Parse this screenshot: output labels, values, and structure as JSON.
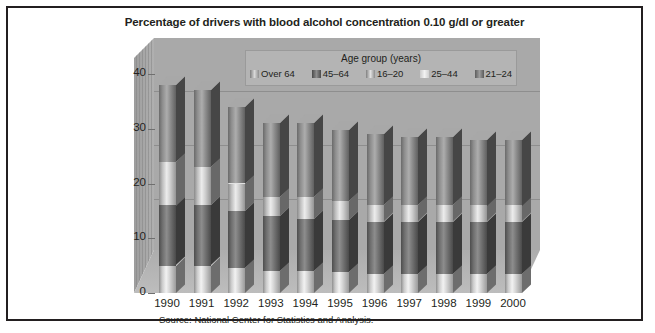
{
  "title": "Percentage of drivers with blood alcohol concentration 0.10 g/dl or greater",
  "source": "Source: National Center for Statistics and Analysis.",
  "legend": {
    "title": "Age group (years)",
    "items": [
      {
        "label": "Over 64",
        "swatch": "legend-swatch-over-64"
      },
      {
        "label": "45–64",
        "swatch": "legend-swatch-45-64"
      },
      {
        "label": "16–20",
        "swatch": "legend-swatch-16-20"
      },
      {
        "label": "25–44",
        "swatch": "legend-swatch-25-44"
      },
      {
        "label": "21–24",
        "swatch": "legend-swatch-21-24"
      }
    ]
  },
  "axes": {
    "y_ticks": [
      "0",
      "10",
      "20",
      "30",
      "40"
    ],
    "x_ticks": [
      "1990",
      "1991",
      "1992",
      "1993",
      "1994",
      "1995",
      "1996",
      "1997",
      "1998",
      "1999",
      "2000"
    ]
  },
  "colors": {
    "frame_border": "#231f20",
    "back_wall": "#a9a9a9",
    "floor": "#b5b5b5",
    "legend_bg": "#b4b4b4",
    "text": "#231f20"
  },
  "chart_data": {
    "type": "bar",
    "subtype": "3d-stacked-column",
    "title": "Percentage of drivers with blood alcohol concentration 0.10 g/dl or greater",
    "xlabel": "",
    "ylabel": "",
    "ylim": [
      0,
      40
    ],
    "yticks": [
      0,
      10,
      20,
      30,
      40
    ],
    "grid": true,
    "legend_position": "top-center-inside",
    "categories": [
      "1990",
      "1991",
      "1992",
      "1993",
      "1994",
      "1995",
      "1996",
      "1997",
      "1998",
      "1999",
      "2000"
    ],
    "series": [
      {
        "name": "Over 64",
        "values": [
          5.0,
          5.0,
          4.5,
          4.0,
          4.0,
          3.8,
          3.5,
          3.5,
          3.5,
          3.5,
          3.5
        ]
      },
      {
        "name": "45–64",
        "values": [
          11.0,
          11.0,
          10.5,
          10.0,
          9.5,
          9.5,
          9.5,
          9.5,
          9.5,
          9.5,
          9.5
        ]
      },
      {
        "name": "16–20",
        "values": [
          8.0,
          7.0,
          5.0,
          3.5,
          4.0,
          3.5,
          3.0,
          3.0,
          3.0,
          3.0,
          3.0
        ]
      },
      {
        "name": "25–44",
        "values": [
          14.0,
          14.0,
          14.0,
          13.5,
          13.5,
          13.0,
          13.0,
          12.5,
          12.5,
          12.0,
          12.0
        ]
      },
      {
        "name": "21–24",
        "values": [
          0,
          0,
          0,
          0,
          0,
          0,
          0,
          0,
          0,
          0,
          0
        ]
      }
    ],
    "totals": [
      38.0,
      37.0,
      34.0,
      31.0,
      31.0,
      29.8,
      29.0,
      28.5,
      28.5,
      28.0,
      28.0
    ]
  }
}
